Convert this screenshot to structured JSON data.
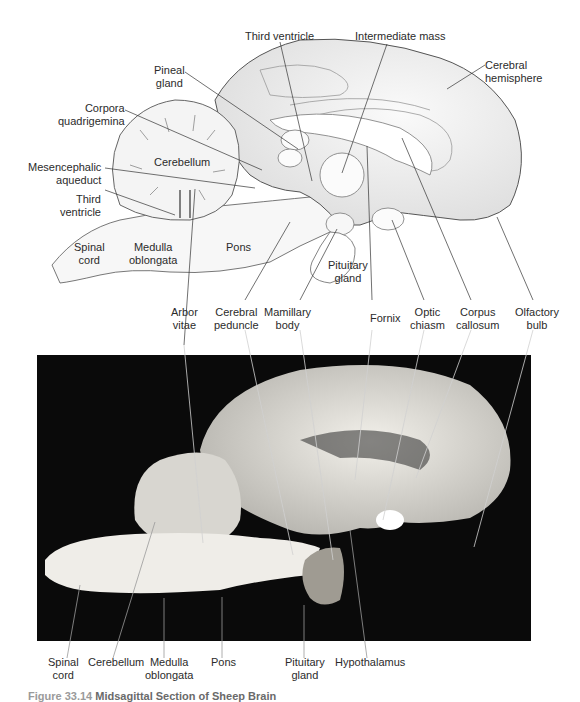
{
  "figure": {
    "caption_number": "Figure 33.14",
    "caption_title": "Midsagittal Section of Sheep Brain"
  },
  "illustration": {
    "labels": {
      "third_ventricle_top": "Third ventricle",
      "intermediate_mass": "Intermediate mass",
      "cerebral_hemisphere_1": "Cerebral",
      "cerebral_hemisphere_2": "hemisphere",
      "pineal_gland_1": "Pineal",
      "pineal_gland_2": "gland",
      "corpora_quadrigemina_1": "Corpora",
      "corpora_quadrigemina_2": "quadrigemina",
      "cerebellum": "Cerebellum",
      "mesencephalic_aqueduct_1": "Mesencephalic",
      "mesencephalic_aqueduct_2": "aqueduct",
      "third_ventricle_left_1": "Third",
      "third_ventricle_left_2": "ventricle",
      "spinal_cord_1": "Spinal",
      "spinal_cord_2": "cord",
      "medulla_oblongata_1": "Medulla",
      "medulla_oblongata_2": "oblongata",
      "pons": "Pons",
      "pituitary_gland_1": "Pituitary",
      "pituitary_gland_2": "gland"
    }
  },
  "middle_labels": {
    "arbor_vitae_1": "Arbor",
    "arbor_vitae_2": "vitae",
    "cerebral_peduncle_1": "Cerebral",
    "cerebral_peduncle_2": "peduncle",
    "mamillary_body_1": "Mamillary",
    "mamillary_body_2": "body",
    "fornix": "Fornix",
    "optic_chiasm_1": "Optic",
    "optic_chiasm_2": "chiasm",
    "corpus_callosum_1": "Corpus",
    "corpus_callosum_2": "callosum",
    "olfactory_bulb_1": "Olfactory",
    "olfactory_bulb_2": "bulb"
  },
  "photo_labels": {
    "spinal_cord_1": "Spinal",
    "spinal_cord_2": "cord",
    "cerebellum": "Cerebellum",
    "medulla_oblongata_1": "Medulla",
    "medulla_oblongata_2": "oblongata",
    "pons": "Pons",
    "pituitary_gland_1": "Pituitary",
    "pituitary_gland_2": "gland",
    "hypothalamus": "Hypothalamus"
  },
  "colors": {
    "background": "#ffffff",
    "outline": "#555555",
    "tissue_fill": "#f3f3f3",
    "tissue_shade": "#d9d9d9",
    "photo_bg": "#0a0a0a",
    "photo_tissue": "#e6e4df",
    "leader_line": "#333333",
    "photo_leader": "#cfcfcf"
  }
}
